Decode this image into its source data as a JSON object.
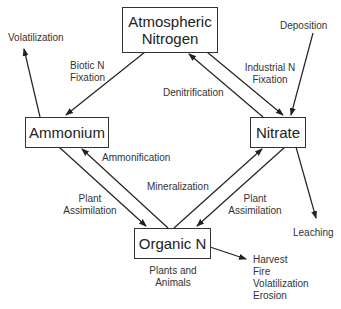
{
  "nodes": {
    "atmospheric": "Atmospheric\nNitrogen",
    "ammonium": "Ammonium",
    "nitrate": "Nitrate",
    "organic": "Organic N"
  },
  "labels": {
    "volatilization_top": "Volatilization",
    "biotic_fixation": "Biotic N\nFixation",
    "deposition": "Deposition",
    "industrial_fixation": "Industrial N\nFixation",
    "denitrification": "Denitrification",
    "ammonification": "Ammonification",
    "mineralization": "Mineralization",
    "plant_assimilation_left": "Plant\nAssimilation",
    "plant_assimilation_right": "Plant\nAssimilation",
    "leaching": "Leaching",
    "plants_animals": "Plants and\nAnimals",
    "losses": "Harvest\nFire\nVolatilization\nErosion"
  },
  "colors": {
    "line": "#222222",
    "box_border": "#333333",
    "text": "#222222"
  }
}
